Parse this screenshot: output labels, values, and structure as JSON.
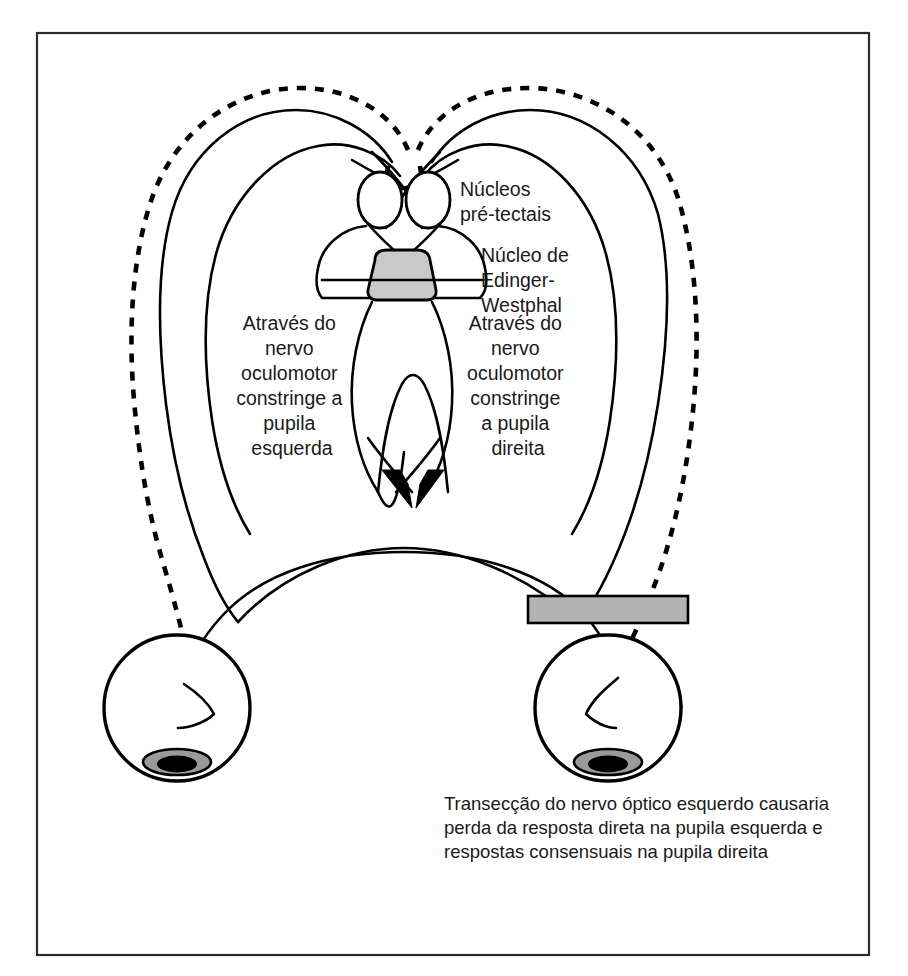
{
  "figure": {
    "language": "pt-BR",
    "frame": {
      "x": 37,
      "y": 33,
      "width": 832,
      "height": 922,
      "border_color": "#2b2b2b"
    },
    "background_color": "#ffffff",
    "line_color": "#000000"
  },
  "labels": {
    "pretectal_nuclei": {
      "lines": [
        "Núcleos",
        "pré-tectais"
      ],
      "line1": "Núcleos",
      "line2": "pré-tectais",
      "x": 460,
      "y": 196
    },
    "edinger_westphal": {
      "lines": [
        "Núcleo de",
        "Edinger-",
        "Westphal"
      ],
      "line1": "Núcleo de",
      "line2": "Edinger-",
      "line3": "Westphal",
      "x": 481,
      "y": 262
    },
    "left_pathway": {
      "lines": [
        "Através do",
        "nervo",
        "oculomotor",
        "constringe a",
        "pupila",
        "esquerda"
      ],
      "line1": "Através do",
      "line2": "nervo",
      "line3": "oculomotor",
      "line4": "constringe a",
      "line5": "pupila",
      "line6": "esquerda",
      "center_x": 292,
      "y": 330
    },
    "right_pathway": {
      "lines": [
        "Através do",
        "nervo",
        "oculomotor",
        "constringe",
        "a pupila",
        "direita"
      ],
      "line1": "Através do",
      "line2": "nervo",
      "line3": "oculomotor",
      "line4": "constringe",
      "line5": "a pupila",
      "line6": "direita",
      "center_x": 518,
      "y": 330
    }
  },
  "caption": {
    "lines": [
      "Transecção do nervo óptico esquerdo causaria",
      "perda da resposta direta na pupila esquerda e",
      "respostas consensuais na pupila direita"
    ],
    "line1": "Transecção do nervo óptico esquerdo causaria",
    "line2": "perda da resposta direta na pupila esquerda e",
    "line3": "respostas consensuais na pupila direita",
    "x": 444,
    "y": 810
  },
  "structures": {
    "edinger_westphal_nucleus": {
      "name": "Núcleo de Edinger-Westphal",
      "shape": "rounded-trapezoid",
      "fill_color": "#c9c9c9",
      "x": 367,
      "y": 258,
      "width": 68,
      "height": 42
    },
    "pretectal_nucleus_left": {
      "name": "Núcleo pré-tectal esquerdo",
      "shape": "ellipse",
      "fill_color": "#ffffff",
      "cx": 380,
      "cy": 200,
      "rx": 22,
      "ry": 28
    },
    "pretectal_nucleus_right": {
      "name": "Núcleo pré-tectal direito",
      "shape": "ellipse",
      "fill_color": "#ffffff",
      "cx": 428,
      "cy": 200,
      "rx": 22,
      "ry": 28
    },
    "transection_bar": {
      "name": "Transecção do nervo óptico",
      "shape": "rectangle",
      "fill_color": "#b3b3b3",
      "x": 528,
      "y": 596,
      "width": 160,
      "height": 27
    },
    "left_eye": {
      "name": "Olho esquerdo",
      "cx": 177,
      "cy": 708,
      "r": 73,
      "pupil_fill": "#000000",
      "iris_fill": "#9a9a9a"
    },
    "right_eye": {
      "name": "Olho direito",
      "cx": 608,
      "cy": 708,
      "r": 73,
      "pupil_fill": "#000000",
      "iris_fill": "#9a9a9a"
    }
  },
  "legend": {
    "solid_line_meaning": "via eferente / trato óptico intacto",
    "dashed_line_meaning": "via aferente do nervo óptico"
  }
}
